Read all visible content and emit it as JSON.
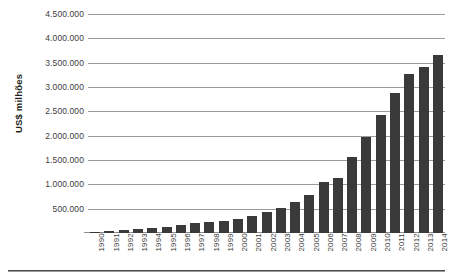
{
  "chart_data": {
    "type": "bar",
    "title": "",
    "xlabel": "",
    "ylabel": "US$ milhões",
    "ylim": [
      0,
      4500000
    ],
    "ytick_step": 500000,
    "grid": true,
    "legend": "none",
    "bar_color": "#3a3a3a",
    "grid_color": "#9b9b9b",
    "categories": [
      "1990",
      "1991",
      "1992",
      "1993",
      "1994",
      "1995",
      "1996",
      "1997",
      "1998",
      "1999",
      "2000",
      "2001",
      "2002",
      "2003",
      "2004",
      "2005",
      "2006",
      "2007",
      "2008",
      "2009",
      "2010",
      "2011",
      "2012",
      "2013",
      "2014"
    ],
    "values": [
      31000,
      45000,
      59000,
      73000,
      108000,
      130000,
      155000,
      205000,
      225000,
      240000,
      290000,
      345000,
      430000,
      515000,
      640000,
      790000,
      1050000,
      1140000,
      1560000,
      1970000,
      2430000,
      2880000,
      3260000,
      3420000,
      3650000
    ],
    "ytick_labels": [
      "500.000",
      "1.000.000",
      "1.500.000",
      "2.000.000",
      "2.500.000",
      "3.000.000",
      "3.500.000",
      "4.000.000",
      "4.500.000"
    ],
    "ytick_values": [
      500000,
      1000000,
      1500000,
      2000000,
      2500000,
      3000000,
      3500000,
      4000000,
      4500000
    ]
  }
}
